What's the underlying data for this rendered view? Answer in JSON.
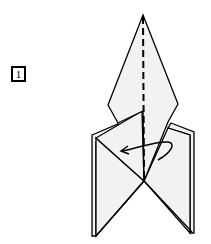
{
  "step": {
    "number": "1"
  },
  "colors": {
    "paper": "#f2f2f2",
    "line": "#000000",
    "background": "#ffffff"
  }
}
